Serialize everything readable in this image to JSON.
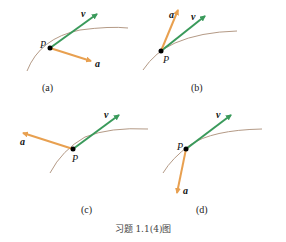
{
  "figure": {
    "title": "习题 1.1(4)图",
    "colors": {
      "velocity": "#3a9a5b",
      "acceleration": "#e8a050",
      "curve": "#b49a86",
      "point": "#000000"
    },
    "panels": [
      {
        "caption": "(a)",
        "point_label": "P",
        "v_label": "v",
        "a_label": "a",
        "a_direction": "down-right, inward"
      },
      {
        "caption": "(b)",
        "point_label": "P",
        "v_label": "v",
        "a_label": "a",
        "a_direction": "up, steeper than v"
      },
      {
        "caption": "(c)",
        "point_label": "P",
        "v_label": "v",
        "a_label": "a",
        "a_direction": "left, backward"
      },
      {
        "caption": "(d)",
        "point_label": "P",
        "v_label": "v",
        "a_label": "a",
        "a_direction": "down"
      }
    ]
  }
}
